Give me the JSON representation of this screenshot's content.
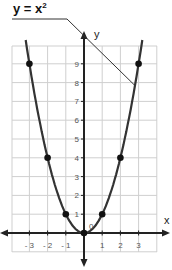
{
  "title": {
    "base": "y = x",
    "sup": "2"
  },
  "axes": {
    "x_label": "x",
    "y_label": "y",
    "origin_label": "0"
  },
  "x_ticks": [
    "- 3",
    "- 2",
    "- 1",
    "1",
    "2",
    "3"
  ],
  "y_ticks": [
    "1",
    "2",
    "3",
    "4",
    "5",
    "6",
    "7",
    "8",
    "9"
  ],
  "colors": {
    "curve": "#333333",
    "grid": "#cfcfcf",
    "axis": "#222222",
    "point": "#111111"
  },
  "chart_data": {
    "type": "line",
    "xlabel": "x",
    "ylabel": "y",
    "x": [
      -3,
      -2,
      -1,
      0,
      1,
      2,
      3
    ],
    "series": [
      {
        "name": "y = x²",
        "values": [
          9,
          4,
          1,
          0,
          1,
          4,
          9
        ],
        "markers": true
      }
    ],
    "x_ticks": [
      -3,
      -2,
      -1,
      1,
      2,
      3
    ],
    "y_ticks": [
      1,
      2,
      3,
      4,
      5,
      6,
      7,
      8,
      9
    ],
    "xlim": [
      -4,
      4
    ],
    "ylim": [
      -1,
      10
    ],
    "grid": true,
    "annotations": [
      {
        "text": "y = x²",
        "points_to": [
          2.8,
          7.84
        ]
      }
    ]
  }
}
